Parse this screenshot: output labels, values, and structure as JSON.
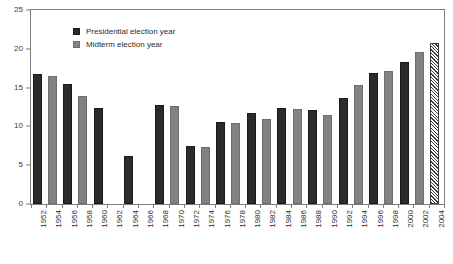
{
  "chart_data": {
    "type": "bar",
    "title": "",
    "subtitle": "",
    "xlabel": "",
    "ylabel": "",
    "ylim": [
      0,
      25
    ],
    "yticks": [
      0,
      5,
      10,
      15,
      20,
      25
    ],
    "grid": false,
    "legend_position": "top-left",
    "categories": [
      "1952",
      "1954",
      "1956",
      "1958",
      "1960",
      "1962",
      "1964",
      "1966",
      "1968",
      "1970",
      "1972",
      "1974",
      "1976",
      "1978",
      "1980",
      "1982",
      "1984",
      "1986",
      "1988",
      "1990",
      "1992",
      "1994",
      "1996",
      "1998",
      "2000",
      "2002",
      "2004"
    ],
    "values": [
      16.7,
      16.5,
      15.5,
      13.9,
      12.4,
      null,
      6.2,
      null,
      12.8,
      12.6,
      7.5,
      7.3,
      10.6,
      10.4,
      11.7,
      10.9,
      12.4,
      12.3,
      12.1,
      11.5,
      13.7,
      15.4,
      16.9,
      17.1,
      18.3,
      19.6,
      20.7
    ],
    "bar_types": [
      "presidential",
      "midterm",
      "presidential",
      "midterm",
      "presidential",
      "midterm",
      "presidential",
      "midterm",
      "presidential",
      "midterm",
      "presidential",
      "midterm",
      "presidential",
      "midterm",
      "presidential",
      "midterm",
      "presidential",
      "midterm",
      "presidential",
      "midterm",
      "presidential",
      "midterm",
      "presidential",
      "midterm",
      "presidential",
      "midterm",
      "projected"
    ],
    "series": [
      {
        "name": "Presidential election year",
        "color": "#2b2b2b",
        "x": [
          "1952",
          "1956",
          "1960",
          "1964",
          "1968",
          "1972",
          "1976",
          "1980",
          "1984",
          "1988",
          "1992",
          "1996",
          "2000"
        ],
        "values": [
          16.7,
          15.5,
          12.4,
          6.2,
          12.8,
          7.5,
          10.6,
          11.7,
          12.4,
          12.1,
          13.7,
          16.9,
          18.3
        ]
      },
      {
        "name": "Midterm election year",
        "color": "#828282",
        "x": [
          "1954",
          "1958",
          "1962",
          "1966",
          "1970",
          "1974",
          "1978",
          "1982",
          "1986",
          "1990",
          "1994",
          "1998",
          "2002"
        ],
        "values": [
          16.5,
          13.9,
          null,
          null,
          12.6,
          7.3,
          10.4,
          10.9,
          12.3,
          11.5,
          15.4,
          17.1,
          19.6
        ]
      },
      {
        "name": "2004 (projected)",
        "color": "#ffffff",
        "x": [
          "2004"
        ],
        "values": [
          20.7
        ]
      }
    ],
    "annotations": []
  },
  "legend": {
    "items": [
      {
        "label": "Presidential election year",
        "type": "presidential"
      },
      {
        "label": "Midterm election year",
        "type": "midterm"
      }
    ]
  },
  "colors": {
    "presidential": "#2b2b2b",
    "midterm": "#828282",
    "projected_outline": "#3a3a3a",
    "frame": "#7d7d7d",
    "text": "#2e2e2e",
    "background": "#ffffff"
  }
}
